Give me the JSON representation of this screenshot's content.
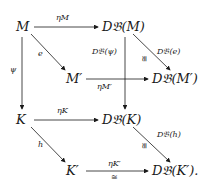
{
  "diagram": {
    "nodes": {
      "M": "M",
      "DM": "D𝔅(M)",
      "Mp": "M′",
      "DMp": "D𝔅(M′)",
      "K": "K",
      "DK": "D𝔅(K)",
      "Kp": "K′",
      "DKp": "D𝔅(K′)."
    },
    "labels": {
      "etaM": "ηM",
      "e": "e",
      "psi": "ψ",
      "Dpsi": "D𝔅(ψ)",
      "De": "D𝔅(e)",
      "etaMp": "ηM′",
      "etaK": "ηK",
      "h": "h",
      "Dh": "D𝔅(h)",
      "etaKp": "ηK′",
      "iso": "≅"
    }
  }
}
